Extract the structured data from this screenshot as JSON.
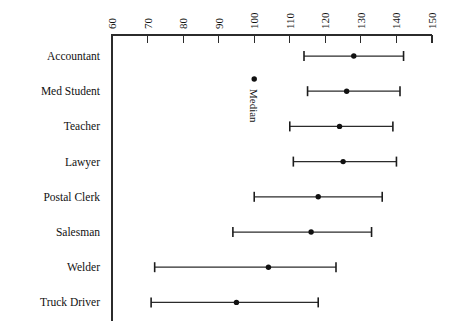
{
  "chart_data": {
    "type": "scatter",
    "title": "",
    "subtitle": "",
    "xlabel": "",
    "ylabel": "",
    "orientation": "horizontal",
    "grid": false,
    "legend_position": "inside-plot",
    "xlim": [
      60,
      150
    ],
    "xticks": [
      60,
      70,
      80,
      90,
      100,
      110,
      120,
      130,
      140,
      150
    ],
    "xtick_labels": [
      "60",
      "70",
      "80",
      "90",
      "100",
      "110",
      "120",
      "130",
      "140",
      "150"
    ],
    "xtick_label_rotation": -90,
    "axis_position": "top",
    "categories": [
      "Accountant",
      "Med Student",
      "Teacher",
      "Lawyer",
      "Postal Clerk",
      "Salesman",
      "Welder",
      "Truck Driver"
    ],
    "series": [
      {
        "name": "Median",
        "marker": "dot",
        "values": [
          128,
          126,
          124,
          125,
          118,
          116,
          104,
          95
        ]
      },
      {
        "name": "Range",
        "marker": "error-bar",
        "low": [
          114,
          115,
          110,
          111,
          100,
          94,
          72,
          71
        ],
        "high": [
          142,
          141,
          139,
          140,
          136,
          133,
          123,
          118
        ]
      }
    ],
    "annotations": [
      {
        "name": "median-legend",
        "label": "Median",
        "x": 100,
        "category_gap_after": "Accountant",
        "marker": "dot",
        "orientation": "vertical"
      }
    ],
    "colors": {
      "marker": "#111111",
      "line": "#2b2b2b",
      "axis": "#2b2b2b",
      "background": "#ffffff",
      "text": "#111111"
    }
  }
}
